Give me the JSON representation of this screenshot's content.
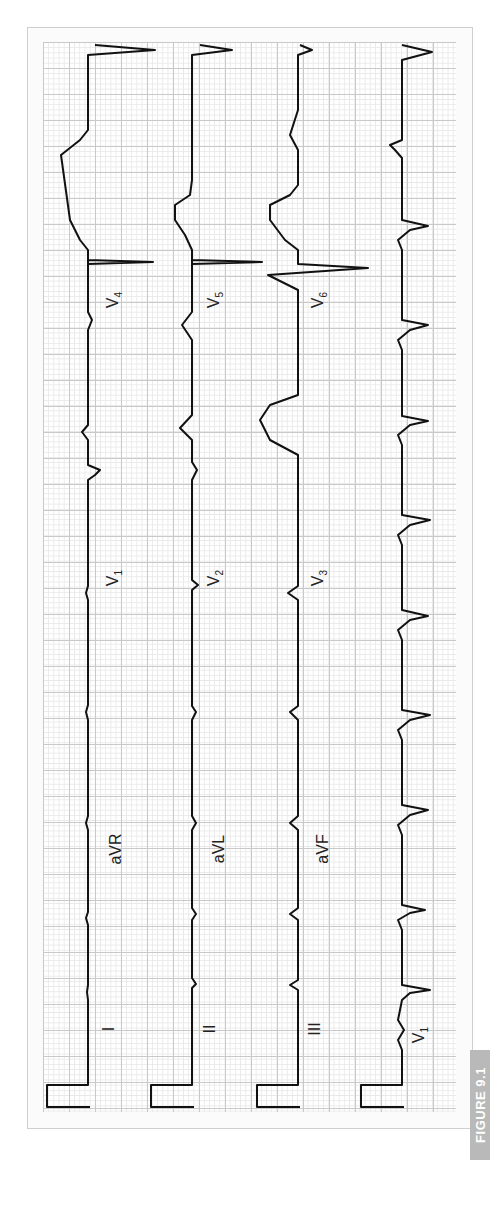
{
  "figure": {
    "label": "FIGURE 9.1",
    "orientation": "rotated 90 degrees counter-clockwise",
    "colors": {
      "grid_major": "#c9c9c9",
      "grid_minor": "#e9e9e9",
      "trace": "#111111",
      "label_bg": "#b9b9b9"
    }
  },
  "rows": [
    {
      "id": "row1",
      "leads": [
        {
          "name": "I"
        },
        {
          "name": "aVR"
        },
        {
          "name": "V",
          "sub": "1"
        },
        {
          "name": "V",
          "sub": "4"
        }
      ]
    },
    {
      "id": "row2",
      "leads": [
        {
          "name": "II"
        },
        {
          "name": "aVL"
        },
        {
          "name": "V",
          "sub": "2"
        },
        {
          "name": "V",
          "sub": "5"
        }
      ]
    },
    {
      "id": "row3",
      "leads": [
        {
          "name": "III"
        },
        {
          "name": "aVF"
        },
        {
          "name": "V",
          "sub": "3"
        },
        {
          "name": "V",
          "sub": "6"
        }
      ]
    },
    {
      "id": "rhythm",
      "leads": [
        {
          "name": "V",
          "sub": "1"
        }
      ]
    }
  ],
  "labels": {
    "I": "I",
    "II": "II",
    "III": "III",
    "aVR": "aVR",
    "aVL": "aVL",
    "aVF": "aVF",
    "V": "V",
    "V1": "1",
    "V2": "2",
    "V3": "3",
    "V4": "4",
    "V5": "5",
    "V6": "6",
    "rhythm_V1": "1"
  }
}
